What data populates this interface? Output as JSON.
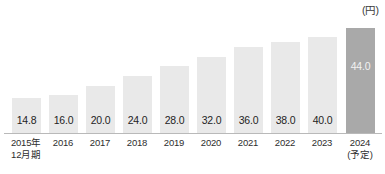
{
  "chart_data": {
    "type": "bar",
    "title": "",
    "subtitle": "",
    "unit_label": "(円)",
    "xlabel": "",
    "ylabel": "",
    "ylim": [
      0,
      48
    ],
    "grid": false,
    "legend": "none",
    "categories": [
      "2015年\n12月期",
      "2016",
      "2017",
      "2018",
      "2019",
      "2020",
      "2021",
      "2022",
      "2023",
      "2024\n(予定)"
    ],
    "values": [
      14.8,
      16.0,
      20.0,
      24.0,
      28.0,
      32.0,
      36.0,
      38.0,
      40.0,
      44.0
    ],
    "data_labels": [
      "14.8",
      "16.0",
      "20.0",
      "24.0",
      "28.0",
      "32.0",
      "36.0",
      "38.0",
      "40.0",
      "44.0"
    ],
    "colors": {
      "bar": "#e9e9e9",
      "bar_forecast": "#a9a9a9",
      "axis_line": "#b9b9b9",
      "label_text": "#242424",
      "forecast_label_text": "#f2f2f2",
      "tick_text": "#2e2e2e"
    },
    "forecast_index": 9
  },
  "ticks": [
    {
      "line1": "2015年",
      "line2": "12月期"
    },
    {
      "line1": "2016",
      "line2": ""
    },
    {
      "line1": "2017",
      "line2": ""
    },
    {
      "line1": "2018",
      "line2": ""
    },
    {
      "line1": "2019",
      "line2": ""
    },
    {
      "line1": "2020",
      "line2": ""
    },
    {
      "line1": "2021",
      "line2": ""
    },
    {
      "line1": "2022",
      "line2": ""
    },
    {
      "line1": "2023",
      "line2": ""
    },
    {
      "line1": "2024",
      "line2": "(予定)"
    }
  ],
  "bars": [
    {
      "label": "14.8"
    },
    {
      "label": "16.0"
    },
    {
      "label": "20.0"
    },
    {
      "label": "24.0"
    },
    {
      "label": "28.0"
    },
    {
      "label": "32.0"
    },
    {
      "label": "36.0"
    },
    {
      "label": "38.0"
    },
    {
      "label": "40.0"
    },
    {
      "label": "44.0"
    }
  ]
}
